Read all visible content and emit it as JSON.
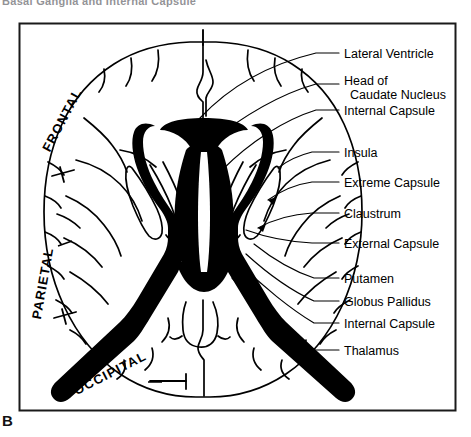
{
  "figure": {
    "panel_label": "B",
    "cropped_header": "Basal Ganglia and Internal Capsule",
    "frame": {
      "x": 19,
      "y": 23,
      "width": 436,
      "height": 387,
      "border_color": "#1a1a1a"
    },
    "ink_color": "#000000",
    "background_color": "#ffffff"
  },
  "lobe_labels": [
    {
      "name": "frontal",
      "text": "FRONTAL",
      "x": 66,
      "y": 118,
      "rotation": -62
    },
    {
      "name": "parietal",
      "text": "PARIETAL",
      "x": 47,
      "y": 280,
      "rotation": -80
    },
    {
      "name": "occipital",
      "text": "OCCIPITAL",
      "x": 112,
      "y": 376,
      "rotation": -27
    }
  ],
  "callouts": [
    {
      "id": "lateral-ventricle",
      "text": "Lateral Ventricle",
      "label_x": 344,
      "label_y": 57,
      "leader": "M336,54 L322,54 L300,62",
      "lines": 1
    },
    {
      "id": "head-of-caudate",
      "text": "Head of",
      "text2": "Caudate Nucleus",
      "label_x": 344,
      "label_y": 84,
      "leader": "M336,88 L320,88 L300,95",
      "lines": 2
    },
    {
      "id": "internal-capsule-1",
      "text": "Internal Capsule",
      "label_x": 344,
      "label_y": 112,
      "leader": "M336,110 L318,110 L300,118",
      "lines": 1
    },
    {
      "id": "insula",
      "text": "Insula",
      "label_x": 344,
      "label_y": 155,
      "leader": "M336,153 L310,153 L296,158",
      "lines": 1
    },
    {
      "id": "extreme-capsule",
      "text": "Extreme Capsule",
      "label_x": 344,
      "label_y": 185,
      "leader": "M336,182 L312,182 L298,187",
      "lines": 1
    },
    {
      "id": "claustrum",
      "text": "Claustrum",
      "label_x": 344,
      "label_y": 216,
      "leader": "M336,214 L312,214 L298,216",
      "lines": 1
    },
    {
      "id": "external-capsule",
      "text": "External Capsule",
      "label_x": 344,
      "label_y": 245,
      "leader": "M336,243 L312,243 L296,240",
      "lines": 1
    },
    {
      "id": "putamen",
      "text": "Putamen",
      "label_x": 344,
      "label_y": 281,
      "leader": "M336,279 L314,279 L300,274",
      "lines": 1
    },
    {
      "id": "globus-pallidus",
      "text": "Globus Pallidus",
      "label_x": 344,
      "label_y": 303,
      "leader": "M336,301 L314,301 L300,296",
      "lines": 1
    },
    {
      "id": "internal-capsule-2",
      "text": "Internal Capsule",
      "label_x": 344,
      "label_y": 325,
      "leader": "M336,323 L314,323 L300,318",
      "lines": 1
    },
    {
      "id": "thalamus",
      "text": "Thalamus",
      "label_x": 344,
      "label_y": 352,
      "leader": "M336,350 L314,350 L300,344",
      "lines": 1
    }
  ],
  "anatomy": {
    "view": "axial section through basal ganglia",
    "ventricle_fill": "#000000",
    "structures_shown": [
      "lateral ventricle",
      "head of caudate nucleus",
      "internal capsule",
      "insula",
      "extreme capsule",
      "claustrum",
      "external capsule",
      "putamen",
      "globus pallidus",
      "thalamus"
    ]
  }
}
